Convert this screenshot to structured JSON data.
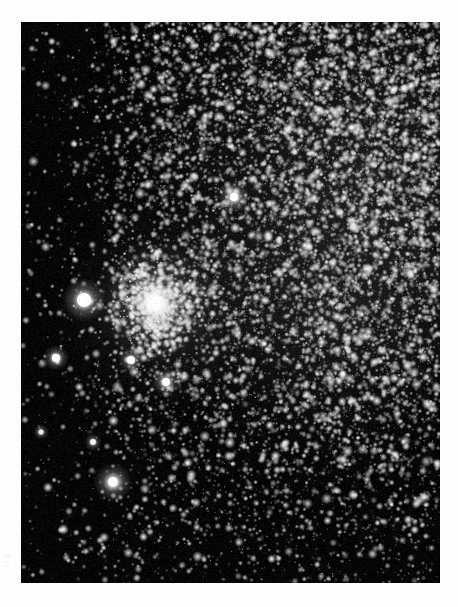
{
  "page": {
    "type": "astronomical-photograph",
    "background_color": "#fdfdfd",
    "width": 458,
    "height": 607
  },
  "plate": {
    "name": "star-field-plate",
    "left": 21,
    "top": 22,
    "width": 419,
    "height": 561,
    "sky_color": "#050505",
    "star_color": "#f2f2f2",
    "description": "Dense monochrome star field containing a globular cluster, a bright foreground star, and faint nebulosity"
  },
  "field": {
    "density_gradient": {
      "note": "Star surface density rises toward the upper-right and falls toward the lower-left and bottom",
      "max_density_corner": "top-right",
      "min_density_corner": "bottom-left"
    },
    "background_glow": [
      {
        "name": "upper-right-milky-glow",
        "cx": 0.82,
        "cy": 0.28,
        "rx": 0.55,
        "ry": 0.55,
        "intensity": 0.17
      },
      {
        "name": "mid-right-glow",
        "cx": 0.72,
        "cy": 0.52,
        "rx": 0.4,
        "ry": 0.34,
        "intensity": 0.1
      },
      {
        "name": "cluster-halo-glow",
        "cx": 0.33,
        "cy": 0.52,
        "rx": 0.19,
        "ry": 0.22,
        "intensity": 0.16
      }
    ],
    "star_layers": [
      {
        "name": "faint-background-stars",
        "count": 17000,
        "size_min": 0.5,
        "size_max": 1.3,
        "brightness_min": 0.18,
        "brightness_max": 0.55
      },
      {
        "name": "mid-stars",
        "count": 5200,
        "size_min": 0.9,
        "size_max": 2.0,
        "brightness_min": 0.4,
        "brightness_max": 0.85
      },
      {
        "name": "resolved-stars",
        "count": 1300,
        "size_min": 1.3,
        "size_max": 2.8,
        "brightness_min": 0.65,
        "brightness_max": 1.0
      }
    ]
  },
  "objects": [
    {
      "name": "globular-cluster-core",
      "label": "globular cluster",
      "cx": 134,
      "cy": 281,
      "core_radius": 9,
      "halo_radius": 62,
      "peak_brightness": 1.0,
      "member_star_count": 900,
      "member_spread": 46
    },
    {
      "name": "bright-foreground-star",
      "label": "bright field star",
      "cx": 63,
      "cy": 278,
      "radius": 7,
      "glow_radius": 22,
      "peak_brightness": 1.0
    },
    {
      "name": "bright-star-west",
      "label": "bright star (west)",
      "cx": 35,
      "cy": 336,
      "radius": 4,
      "glow_radius": 13,
      "peak_brightness": 0.95
    },
    {
      "name": "bright-star-below-cluster",
      "label": "star below cluster",
      "cx": 110,
      "cy": 338,
      "radius": 4,
      "glow_radius": 12,
      "peak_brightness": 0.93
    },
    {
      "name": "bright-star-lower-cluster",
      "label": "star south of cluster",
      "cx": 145,
      "cy": 360,
      "radius": 4,
      "glow_radius": 14,
      "peak_brightness": 0.92
    },
    {
      "name": "bright-star-north",
      "label": "star north of cluster",
      "cx": 213,
      "cy": 175,
      "radius": 4,
      "glow_radius": 16,
      "peak_brightness": 0.95
    },
    {
      "name": "fuzzy-nebulous-knot",
      "label": "small nebulous knot",
      "cx": 92,
      "cy": 460,
      "radius": 5,
      "glow_radius": 20,
      "peak_brightness": 0.88
    },
    {
      "name": "star-lower-left",
      "label": "star lower left",
      "cx": 72,
      "cy": 420,
      "radius": 3,
      "glow_radius": 9,
      "peak_brightness": 0.8
    },
    {
      "name": "star-mid-left",
      "label": "star mid left",
      "cx": 20,
      "cy": 410,
      "radius": 2.5,
      "glow_radius": 8,
      "peak_brightness": 0.75
    }
  ],
  "edge_marks": [
    {
      "name": "left-margin-artifact-1",
      "left": 4,
      "top": 556,
      "width": 7,
      "height": 1,
      "opacity": 0.3
    },
    {
      "name": "left-margin-artifact-2",
      "left": 3,
      "top": 561,
      "width": 5,
      "height": 1,
      "opacity": 0.24
    },
    {
      "name": "left-margin-artifact-3",
      "left": 5,
      "top": 566,
      "width": 4,
      "height": 1,
      "opacity": 0.2
    }
  ]
}
